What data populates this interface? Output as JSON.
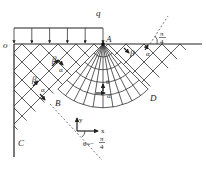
{
  "figure": {
    "load_label": "q",
    "points": {
      "origin": "o",
      "A": "A",
      "B": "B",
      "C": "C",
      "D": "D"
    },
    "line_families": {
      "alpha": "α",
      "beta": "β"
    },
    "angle_labels": {
      "theta": "θ",
      "pi_over_4_num": "π",
      "pi_over_4_den": "4",
      "theta_eq": "θ=−",
      "theta_eq_num": "π",
      "theta_eq_den": "4"
    },
    "axes": {
      "x": "x",
      "y": "y"
    },
    "load_arrow_count": 6
  }
}
